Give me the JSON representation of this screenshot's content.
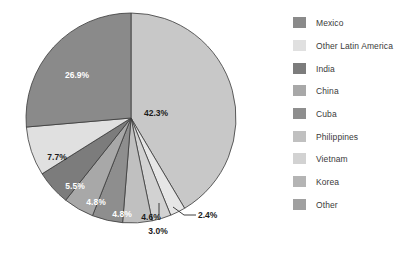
{
  "chart_data": {
    "type": "pie",
    "title": "",
    "legend_position": "right",
    "start_angle_deg": 0,
    "direction": "clockwise",
    "categories": [
      "Mexico",
      "Other Latin America",
      "India",
      "China",
      "Cuba",
      "Philippines",
      "Vietnam",
      "Korea",
      "Other"
    ],
    "values": [
      42.3,
      2.4,
      3.0,
      4.6,
      4.8,
      4.8,
      5.5,
      7.7,
      26.9
    ],
    "value_labels": [
      "42.3%",
      "2.4%",
      "3.0%",
      "4.6%",
      "4.8%",
      "4.8%",
      "5.5%",
      "7.7%",
      "26.9%"
    ],
    "slice_colors": [
      "#c8c8c8",
      "#e6e6e6",
      "#d2d2d2",
      "#c0c0c0",
      "#8e8e8e",
      "#a8a8a8",
      "#7c7c7c",
      "#e0e0e0",
      "#8a8a8a"
    ],
    "label_text_colors": [
      "#1b1b1b",
      "#1b1b1b",
      "#1b1b1b",
      "#1b1b1b",
      "#ffffff",
      "#ffffff",
      "#ffffff",
      "#1b1b1b",
      "#ffffff"
    ],
    "slices": [
      {
        "label": "Mexico",
        "value": 42.3,
        "value_label": "42.3%",
        "color": "#c8c8c8"
      },
      {
        "label": "Other Latin America",
        "value": 2.4,
        "value_label": "2.4%",
        "color": "#e6e6e6"
      },
      {
        "label": "India",
        "value": 3.0,
        "value_label": "3.0%",
        "color": "#d2d2d2"
      },
      {
        "label": "China",
        "value": 4.6,
        "value_label": "4.6%",
        "color": "#c0c0c0"
      },
      {
        "label": "Cuba",
        "value": 4.8,
        "value_label": "4.8%",
        "color": "#8e8e8e"
      },
      {
        "label": "Philippines",
        "value": 4.8,
        "value_label": "4.8%",
        "color": "#a8a8a8"
      },
      {
        "label": "Vietnam",
        "value": 5.5,
        "value_label": "5.5%",
        "color": "#7c7c7c"
      },
      {
        "label": "Korea",
        "value": 7.7,
        "value_label": "7.7%",
        "color": "#e0e0e0"
      },
      {
        "label": "Other",
        "value": 26.9,
        "value_label": "26.9%",
        "color": "#8a8a8a"
      }
    ]
  },
  "legend": {
    "items": [
      {
        "label": "Mexico",
        "color": "#8a8a8a"
      },
      {
        "label": "Other Latin America",
        "color": "#e0e0e0"
      },
      {
        "label": "India",
        "color": "#7c7c7c"
      },
      {
        "label": "China",
        "color": "#a8a8a8"
      },
      {
        "label": "Cuba",
        "color": "#8e8e8e"
      },
      {
        "label": "Philippines",
        "color": "#c0c0c0"
      },
      {
        "label": "Vietnam",
        "color": "#d2d2d2"
      },
      {
        "label": "Korea",
        "color": "#b4b4b4"
      },
      {
        "label": "Other",
        "color": "#a0a0a0"
      }
    ]
  },
  "labels": {
    "mexico_pct": "42.3%",
    "other_pct": "26.9%",
    "korea_pct": "7.7%",
    "vietnam_pct": "5.5%",
    "philippines_pct": "4.8%",
    "cuba_pct": "4.8%",
    "china_pct": "4.6%",
    "india_pct": "3.0%",
    "other_latin_america_pct": "2.4%"
  }
}
